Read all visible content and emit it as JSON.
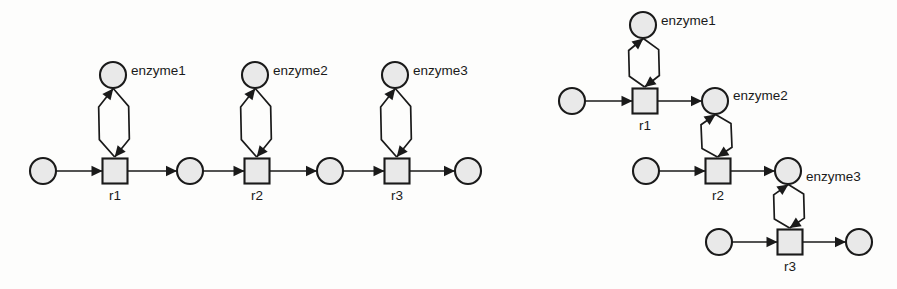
{
  "figure": {
    "title": "",
    "background_color": "#fdfdfc",
    "node_fill": "#e9e9e9",
    "stroke_color": "#1a1a1a"
  },
  "diagrams": [
    {
      "id": "linear-chain",
      "layout": "horizontal-linear",
      "transitions": [
        {
          "id": "r1",
          "label": "r1",
          "x": 115,
          "y": 171,
          "size": 25
        },
        {
          "id": "r2",
          "label": "r2",
          "x": 257,
          "y": 171,
          "size": 25
        },
        {
          "id": "r3",
          "label": "r3",
          "x": 397,
          "y": 171,
          "size": 25
        }
      ],
      "places": [
        {
          "id": "s0",
          "label": "",
          "x": 43,
          "y": 171,
          "r": 13
        },
        {
          "id": "s1",
          "label": "",
          "x": 190,
          "y": 171,
          "r": 13
        },
        {
          "id": "s2",
          "label": "",
          "x": 330,
          "y": 171,
          "r": 13
        },
        {
          "id": "s3",
          "label": "",
          "x": 468,
          "y": 171,
          "r": 13
        },
        {
          "id": "e1",
          "label": "enzyme1",
          "x": 113,
          "y": 75,
          "r": 13,
          "label_x": 131,
          "label_y": 71
        },
        {
          "id": "e2",
          "label": "enzyme2",
          "x": 255,
          "y": 75,
          "r": 13,
          "label_x": 273,
          "label_y": 71
        },
        {
          "id": "e3",
          "label": "enzyme3",
          "x": 395,
          "y": 75,
          "r": 13,
          "label_x": 413,
          "label_y": 71
        }
      ],
      "arcs": [
        {
          "from": "s0",
          "to": "r1",
          "kind": "substrate"
        },
        {
          "from": "r1",
          "to": "s1",
          "kind": "product"
        },
        {
          "from": "s1",
          "to": "r2",
          "kind": "substrate"
        },
        {
          "from": "r2",
          "to": "s2",
          "kind": "product"
        },
        {
          "from": "s2",
          "to": "r3",
          "kind": "substrate"
        },
        {
          "from": "r3",
          "to": "s3",
          "kind": "product"
        },
        {
          "from": "e1",
          "to": "r1",
          "kind": "enzyme-in"
        },
        {
          "from": "r1",
          "to": "e1",
          "kind": "enzyme-out"
        },
        {
          "from": "e2",
          "to": "r2",
          "kind": "enzyme-in"
        },
        {
          "from": "r2",
          "to": "e2",
          "kind": "enzyme-out"
        },
        {
          "from": "e3",
          "to": "r3",
          "kind": "enzyme-in"
        },
        {
          "from": "r3",
          "to": "e3",
          "kind": "enzyme-out"
        }
      ]
    },
    {
      "id": "cascade-chain",
      "layout": "diagonal-cascade",
      "transitions": [
        {
          "id": "r1",
          "label": "r1",
          "x": 645,
          "y": 101,
          "size": 25
        },
        {
          "id": "r2",
          "label": "r2",
          "x": 718,
          "y": 171,
          "size": 25
        },
        {
          "id": "r3",
          "label": "r3",
          "x": 790,
          "y": 242,
          "size": 25
        }
      ],
      "places": [
        {
          "id": "s0",
          "label": "",
          "x": 572,
          "y": 101,
          "r": 13
        },
        {
          "id": "s1",
          "label": "",
          "x": 646,
          "y": 171,
          "r": 13
        },
        {
          "id": "s2",
          "label": "",
          "x": 719,
          "y": 242,
          "r": 13
        },
        {
          "id": "s3",
          "label": "",
          "x": 859,
          "y": 242,
          "r": 13
        },
        {
          "id": "e1",
          "label": "enzyme1",
          "x": 643,
          "y": 25,
          "r": 13,
          "label_x": 661,
          "label_y": 21
        },
        {
          "id": "e2",
          "label": "enzyme2",
          "x": 715,
          "y": 101,
          "r": 13,
          "label_x": 733,
          "label_y": 96
        },
        {
          "id": "e3",
          "label": "enzyme3",
          "x": 788,
          "y": 171,
          "r": 13,
          "label_x": 806,
          "label_y": 177
        }
      ],
      "arcs": [
        {
          "from": "s0",
          "to": "r1",
          "kind": "substrate"
        },
        {
          "from": "r1",
          "to": "e2",
          "kind": "product"
        },
        {
          "from": "s1",
          "to": "r2",
          "kind": "substrate"
        },
        {
          "from": "r2",
          "to": "e3",
          "kind": "product"
        },
        {
          "from": "s2",
          "to": "r3",
          "kind": "substrate"
        },
        {
          "from": "r3",
          "to": "s3",
          "kind": "product"
        },
        {
          "from": "e1",
          "to": "r1",
          "kind": "enzyme-in"
        },
        {
          "from": "r1",
          "to": "e1",
          "kind": "enzyme-out"
        },
        {
          "from": "e2",
          "to": "r2",
          "kind": "enzyme-in"
        },
        {
          "from": "r2",
          "to": "e2",
          "kind": "enzyme-out"
        },
        {
          "from": "e3",
          "to": "r3",
          "kind": "enzyme-in"
        },
        {
          "from": "r3",
          "to": "e3",
          "kind": "enzyme-out"
        }
      ]
    }
  ],
  "labels": {
    "enzyme1": "enzyme1",
    "enzyme2": "enzyme2",
    "enzyme3": "enzyme3",
    "r1": "r1",
    "r2": "r2",
    "r3": "r3"
  }
}
